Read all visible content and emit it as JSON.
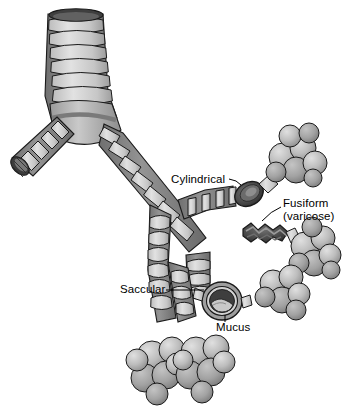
{
  "figure": {
    "background_color": "#ffffff"
  },
  "labels": {
    "cylindrical": "Cylindrical",
    "fusiform_line1": "Fusiform",
    "fusiform_line2": "(varicose)",
    "saccular": "Saccular",
    "mucus": "Mucus"
  },
  "anatomy": {
    "trachea": "trachea",
    "left_main_bronchus": "left-main-bronchus",
    "right_main_bronchus": "right-main-bronchus",
    "alveolar_clusters": 5
  },
  "colors": {
    "cartilage_light": "#d5d5d5",
    "cartilage_mid": "#b4b4b4",
    "airway_dark": "#8a8a8a",
    "lumen_dark": "#4a4a4a",
    "outline": "#1a1a1a",
    "alveoli_light": "#cfcfcf",
    "alveoli_mid": "#a8a8a8",
    "mucus": "#bdbdbd",
    "label_text": "#000000"
  }
}
